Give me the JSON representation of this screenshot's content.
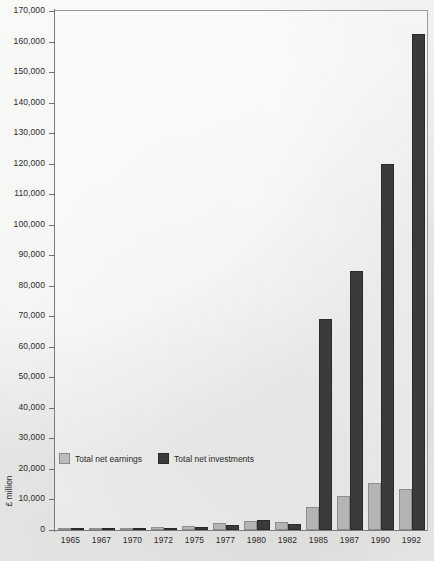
{
  "chart_data": {
    "type": "bar",
    "title": "",
    "xlabel": "",
    "ylabel": "£ million",
    "ylim": [
      0,
      170000
    ],
    "ytick_step": 10000,
    "grid": false,
    "legend_position": "inside-bottom-left",
    "categories": [
      "1965",
      "1967",
      "1970",
      "1972",
      "1975",
      "1977",
      "1980",
      "1982",
      "1985",
      "1987",
      "1990",
      "1992"
    ],
    "ytick_labels": [
      "170,000",
      "160,000",
      "150,000",
      "140,000",
      "130,000",
      "120,000",
      "110,000",
      "100,000",
      "90,000",
      "80,000",
      "70,000",
      "60,000",
      "50,000",
      "40,000",
      "30,000",
      "20,000",
      "10,000",
      "0"
    ],
    "series": [
      {
        "name": "Total net earnings",
        "color": "#b4b4b4",
        "values": [
          300,
          400,
          700,
          900,
          1400,
          2200,
          2900,
          2700,
          7500,
          11000,
          15500,
          13500
        ]
      },
      {
        "name": "Total net investments",
        "color": "#3b3b3b",
        "values": [
          200,
          300,
          500,
          700,
          1100,
          1700,
          3300,
          2100,
          69000,
          85000,
          120000,
          162500
        ]
      }
    ]
  },
  "legend": {
    "items": [
      {
        "label": "Total net earnings",
        "swatch": "light-gray-swatch"
      },
      {
        "label": "Total net investments",
        "swatch": "dark-gray-swatch"
      }
    ]
  },
  "axes": {
    "y_title": "£ million"
  }
}
